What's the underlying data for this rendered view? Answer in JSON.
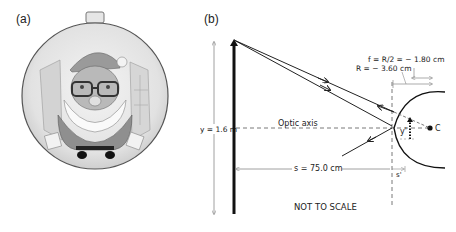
{
  "panel_a": {
    "label": "(a)",
    "description": "Santa Claus reflected in a convex spherical Christmas ornament"
  },
  "panel_b": {
    "label": "(b)",
    "annotations": {
      "focal": "f = R/2 = − 1.80 cm",
      "radius": "R = − 3.60 cm",
      "object_height": "y = 1.6 m",
      "optic_axis": "Optic axis",
      "object_distance": "s = 75.0 cm",
      "image_distance": "s'",
      "image_height": "y'",
      "center": "C",
      "note": "NOT TO SCALE"
    }
  }
}
